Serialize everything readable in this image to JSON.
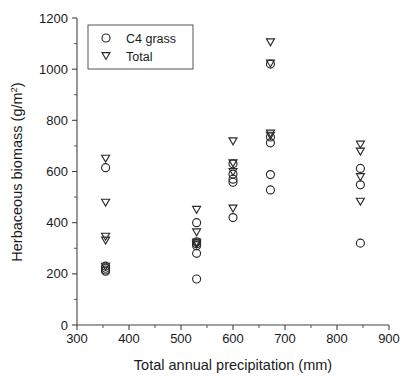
{
  "chart_data": {
    "type": "scatter",
    "title": "",
    "xlabel": "Total annual precipitation (mm)",
    "ylabel": "Herbaceous biomass (g/m2)",
    "ylabel_base": "Herbaceous biomass (g/m",
    "ylabel_sup": "2",
    "ylabel_tail": ")",
    "xlim": [
      300,
      900
    ],
    "ylim": [
      0,
      1200
    ],
    "xticks": [
      300,
      400,
      500,
      600,
      700,
      800,
      900
    ],
    "yticks": [
      0,
      200,
      400,
      600,
      800,
      1000,
      1200
    ],
    "xticklabels": [
      "300",
      "400",
      "500",
      "600",
      "700",
      "800",
      "900"
    ],
    "yticklabels": [
      "0",
      "200",
      "400",
      "600",
      "800",
      "1000",
      "1200"
    ],
    "x_minor_ticks": [
      350,
      450,
      550,
      650,
      750,
      850
    ],
    "y_minor_ticks": [
      100,
      300,
      500,
      700,
      900,
      1100
    ],
    "grid": false,
    "legend_position": "upper-left",
    "marker_color": "#2a2a2a",
    "series": [
      {
        "name": "C4 grass",
        "marker": "circle",
        "points": [
          [
            355,
            615
          ],
          [
            355,
            230
          ],
          [
            355,
            222
          ],
          [
            355,
            215
          ],
          [
            355,
            210
          ],
          [
            530,
            400
          ],
          [
            530,
            325
          ],
          [
            530,
            318
          ],
          [
            530,
            310
          ],
          [
            530,
            280
          ],
          [
            530,
            180
          ],
          [
            600,
            630
          ],
          [
            600,
            590
          ],
          [
            600,
            570
          ],
          [
            600,
            558
          ],
          [
            600,
            420
          ],
          [
            672,
            1020
          ],
          [
            672,
            735
          ],
          [
            672,
            712
          ],
          [
            672,
            588
          ],
          [
            672,
            528
          ],
          [
            845,
            612
          ],
          [
            845,
            548
          ],
          [
            845,
            320
          ]
        ]
      },
      {
        "name": "Total",
        "marker": "triangle-down",
        "points": [
          [
            355,
            650
          ],
          [
            355,
            478
          ],
          [
            355,
            345
          ],
          [
            355,
            330
          ],
          [
            355,
            228
          ],
          [
            530,
            450
          ],
          [
            530,
            362
          ],
          [
            530,
            322
          ],
          [
            530,
            315
          ],
          [
            600,
            718
          ],
          [
            600,
            632
          ],
          [
            600,
            598
          ],
          [
            600,
            455
          ],
          [
            672,
            1105
          ],
          [
            672,
            1022
          ],
          [
            672,
            748
          ],
          [
            672,
            740
          ],
          [
            845,
            705
          ],
          [
            845,
            678
          ],
          [
            845,
            578
          ],
          [
            845,
            482
          ]
        ]
      }
    ],
    "legend_entries": [
      {
        "label": "C4 grass",
        "marker": "circle"
      },
      {
        "label": "Total",
        "marker": "triangle-down"
      }
    ]
  },
  "layout": {
    "plot_left": 77,
    "plot_right": 389,
    "plot_top": 18,
    "plot_bottom": 325,
    "legend": {
      "x": 88,
      "y": 25,
      "w": 105,
      "h": 44
    }
  }
}
